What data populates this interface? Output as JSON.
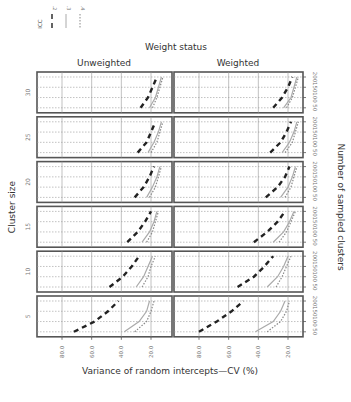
{
  "chart_data": {
    "type": "line",
    "title": "Weight status",
    "column_facets": [
      "Unweighted",
      "Weighted"
    ],
    "row_facet_label": "Cluster size",
    "row_facets": [
      30,
      25,
      20,
      15,
      10,
      5
    ],
    "xlabel": "Variance of random intercepts—CV (%)",
    "ylabel": "Number of sampled clusters",
    "x_ticks": [
      "80.0",
      "60.0",
      "40.0",
      "20.0"
    ],
    "x_reversed": true,
    "xlim": [
      90,
      10
    ],
    "y_ticks": [
      "50",
      "100",
      "150",
      "200"
    ],
    "ylim": [
      40,
      210
    ],
    "grid": true,
    "legend": {
      "title": "ICC",
      "entries": [
        {
          "label": ".2",
          "style": "dashed",
          "color": "#222222"
        },
        {
          "label": ".3",
          "style": "solid",
          "color": "#aaaaaa"
        },
        {
          "label": ".4",
          "style": "dotted",
          "color": "#888888"
        }
      ],
      "position": "top-left"
    },
    "y": [
      50,
      100,
      150,
      200
    ],
    "panels": [
      {
        "cluster_size": 30,
        "weight": "Unweighted",
        "series": [
          {
            "name": ".2",
            "values": [
              27,
              22,
              19,
              16
            ]
          },
          {
            "name": ".3",
            "values": [
              21,
              17,
              15,
              13
            ]
          },
          {
            "name": ".4",
            "values": [
              19,
              16,
              14,
              12
            ]
          }
        ]
      },
      {
        "cluster_size": 30,
        "weight": "Weighted",
        "series": [
          {
            "name": ".2",
            "values": [
              30,
              24,
              20,
              17
            ]
          },
          {
            "name": ".3",
            "values": [
              23,
              18,
              16,
              14
            ]
          },
          {
            "name": ".4",
            "values": [
              21,
              17,
              15,
              13
            ]
          }
        ]
      },
      {
        "cluster_size": 25,
        "weight": "Unweighted",
        "series": [
          {
            "name": ".2",
            "values": [
              29,
              23,
              20,
              17
            ]
          },
          {
            "name": ".3",
            "values": [
              22,
              18,
              15,
              13
            ]
          },
          {
            "name": ".4",
            "values": [
              20,
              16,
              14,
              12
            ]
          }
        ]
      },
      {
        "cluster_size": 25,
        "weight": "Weighted",
        "series": [
          {
            "name": ".2",
            "values": [
              32,
              25,
              21,
              18
            ]
          },
          {
            "name": ".3",
            "values": [
              24,
              19,
              16,
              14
            ]
          },
          {
            "name": ".4",
            "values": [
              22,
              17,
              15,
              13
            ]
          }
        ]
      },
      {
        "cluster_size": 20,
        "weight": "Unweighted",
        "series": [
          {
            "name": ".2",
            "values": [
              31,
              25,
              21,
              18
            ]
          },
          {
            "name": ".3",
            "values": [
              23,
              19,
              16,
              14
            ]
          },
          {
            "name": ".4",
            "values": [
              21,
              17,
              15,
              13
            ]
          }
        ]
      },
      {
        "cluster_size": 20,
        "weight": "Weighted",
        "series": [
          {
            "name": ".2",
            "values": [
              35,
              27,
              22,
              19
            ]
          },
          {
            "name": ".3",
            "values": [
              25,
              20,
              17,
              15
            ]
          },
          {
            "name": ".4",
            "values": [
              22,
              18,
              16,
              14
            ]
          }
        ]
      },
      {
        "cluster_size": 15,
        "weight": "Unweighted",
        "series": [
          {
            "name": ".2",
            "values": [
              36,
              29,
              24,
              20
            ]
          },
          {
            "name": ".3",
            "values": [
              26,
              21,
              18,
              16
            ]
          },
          {
            "name": ".4",
            "values": [
              23,
              19,
              17,
              15
            ]
          }
        ]
      },
      {
        "cluster_size": 15,
        "weight": "Weighted",
        "series": [
          {
            "name": ".2",
            "values": [
              43,
              34,
              27,
              22
            ]
          },
          {
            "name": ".3",
            "values": [
              30,
              23,
              19,
              16
            ]
          },
          {
            "name": ".4",
            "values": [
              26,
              21,
              18,
              15
            ]
          }
        ]
      },
      {
        "cluster_size": 10,
        "weight": "Unweighted",
        "series": [
          {
            "name": ".2",
            "values": [
              48,
              39,
              33,
              28
            ]
          },
          {
            "name": ".3",
            "values": [
              30,
              25,
              22,
              19
            ]
          },
          {
            "name": ".4",
            "values": [
              26,
              22,
              20,
              17
            ]
          }
        ]
      },
      {
        "cluster_size": 10,
        "weight": "Weighted",
        "series": [
          {
            "name": ".2",
            "values": [
              54,
              43,
              36,
              30
            ]
          },
          {
            "name": ".3",
            "values": [
              34,
              27,
              23,
              20
            ]
          },
          {
            "name": ".4",
            "values": [
              28,
              24,
              21,
              18
            ]
          }
        ]
      },
      {
        "cluster_size": 5,
        "weight": "Unweighted",
        "series": [
          {
            "name": ".2",
            "values": [
              72,
              58,
              49,
              42
            ]
          },
          {
            "name": ".3",
            "values": [
              38,
              28,
              23,
              21
            ]
          },
          {
            "name": ".4",
            "values": [
              31,
              23,
              20,
              18
            ]
          }
        ]
      },
      {
        "cluster_size": 5,
        "weight": "Weighted",
        "series": [
          {
            "name": ".2",
            "values": [
              80,
              68,
              58,
              50
            ]
          },
          {
            "name": ".3",
            "values": [
              42,
              30,
              25,
              22
            ]
          },
          {
            "name": ".4",
            "values": [
              34,
              25,
              21,
              19
            ]
          }
        ]
      }
    ]
  }
}
